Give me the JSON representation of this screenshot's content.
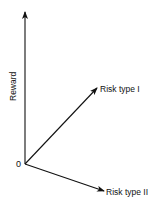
{
  "diagram": {
    "type": "vector-axes",
    "origin_label": "0",
    "axes": [
      {
        "id": "reward",
        "label": "Reward",
        "direction": "up",
        "rotated_label": true
      },
      {
        "id": "risk-type-1",
        "label": "Risk type I",
        "direction": "up-right"
      },
      {
        "id": "risk-type-2",
        "label": "Risk type II",
        "direction": "down-right"
      }
    ],
    "colors": {
      "stroke": "#111111",
      "background": "#ffffff"
    }
  }
}
